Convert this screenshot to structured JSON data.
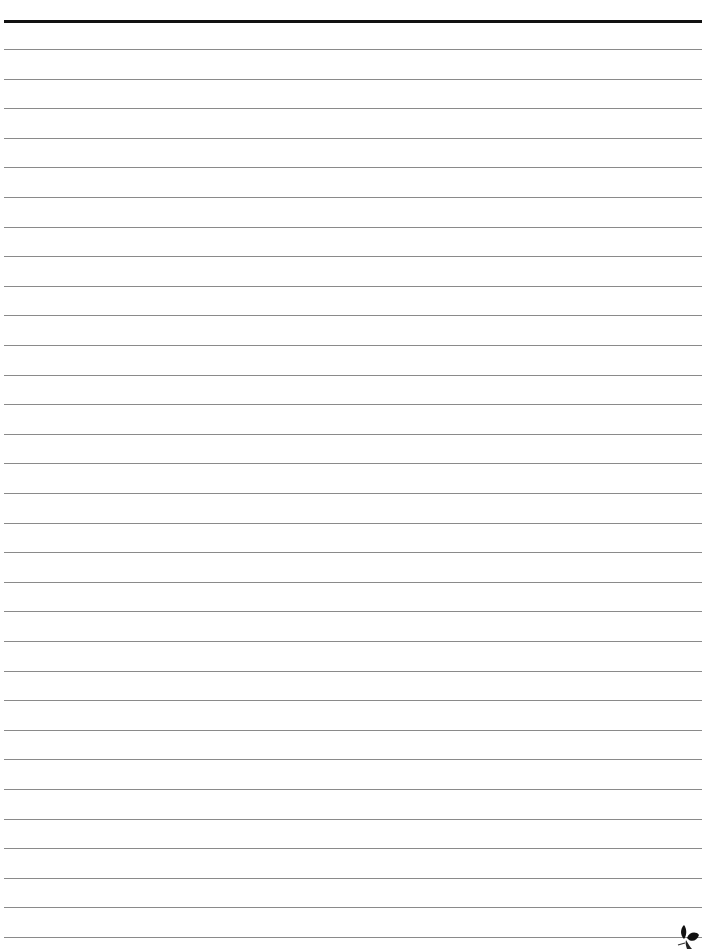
{
  "page": {
    "type": "lined-paper",
    "background": "#ffffff",
    "header_rule": {
      "top": 20,
      "thickness": 3,
      "color": "#111111"
    },
    "rules": {
      "first_top": 49,
      "spacing": 29.6,
      "count": 31,
      "color": "#8a8a8a"
    },
    "ornament": {
      "icon": "leaf-ornament-icon",
      "color": "#111111"
    }
  }
}
